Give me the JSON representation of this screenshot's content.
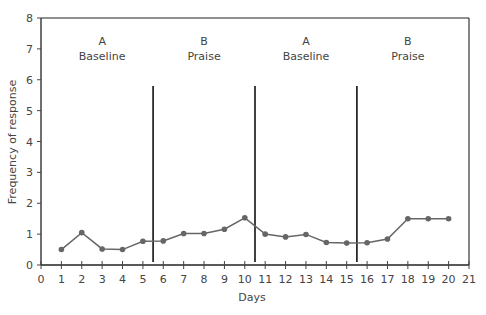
{
  "chart_data": {
    "type": "line",
    "title": "",
    "xlabel": "Days",
    "ylabel": "Frequency of response",
    "xlim": [
      0,
      21
    ],
    "ylim": [
      0,
      8
    ],
    "x_ticks": [
      0,
      1,
      2,
      3,
      4,
      5,
      6,
      7,
      8,
      9,
      10,
      11,
      12,
      13,
      14,
      15,
      16,
      17,
      18,
      19,
      20,
      21
    ],
    "y_ticks": [
      0,
      1,
      2,
      3,
      4,
      5,
      6,
      7,
      8
    ],
    "grid": false,
    "legend": null,
    "series": [
      {
        "name": "Frequency of response",
        "x": [
          1,
          2,
          3,
          4,
          5,
          6,
          7,
          8,
          9,
          10,
          11,
          12,
          13,
          14,
          15,
          16,
          17,
          18,
          19,
          20
        ],
        "values": [
          0.5,
          1.05,
          0.52,
          0.5,
          0.77,
          0.78,
          1.02,
          1.02,
          1.16,
          1.53,
          1.0,
          0.91,
          0.99,
          0.73,
          0.71,
          0.72,
          0.84,
          1.5,
          1.5,
          1.5
        ],
        "color": "#666666"
      }
    ],
    "phase_lines": [
      5.5,
      10.5,
      15.5
    ],
    "phase_line_top": 5.8,
    "phases": [
      {
        "letter": "A",
        "label": "Baseline",
        "center_x": 3
      },
      {
        "letter": "B",
        "label": "Praise",
        "center_x": 8
      },
      {
        "letter": "A",
        "label": "Baseline",
        "center_x": 13
      },
      {
        "letter": "B",
        "label": "Praise",
        "center_x": 18
      }
    ],
    "phase_label_y": [
      7,
      6.5
    ],
    "segments": [
      [
        1,
        2,
        3,
        4,
        5,
        6,
        7,
        8,
        9,
        10,
        11,
        12,
        13,
        14,
        15,
        16,
        17,
        18,
        19,
        20
      ]
    ]
  }
}
